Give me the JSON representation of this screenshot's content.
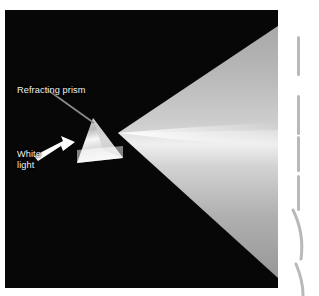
{
  "figure": {
    "kind": "photograph",
    "background_color": "#070707",
    "page_background": "#ffffff"
  },
  "annotations": {
    "prism_label": "Refracting prism",
    "white_light_label_line1": "White",
    "white_light_label_line2": "light",
    "label_color": "#f2f2f2",
    "leader_line_color": "#8c8c8c",
    "arrow_color": "#ffffff"
  },
  "prism": {
    "name": "refracting-prism",
    "fill_color": "#e8e8e8",
    "apex_top": "93,118",
    "base_left": "77,163",
    "base_right": "123,158"
  },
  "spectrum": {
    "name": "dispersed-light-fan",
    "apex": "118,133",
    "colors": [
      "#b2b2b2",
      "#efefef",
      "#c9c9c9",
      "#9a9a9a"
    ],
    "description": "grayscale fan of refracted light spreading right from the prism"
  },
  "margin_marks": {
    "color": "#b9b9b9",
    "dashes": [
      {
        "top": 36,
        "height": 40
      },
      {
        "top": 95,
        "height": 40
      },
      {
        "top": 136,
        "height": 36
      },
      {
        "top": 175,
        "height": 36
      }
    ],
    "arcs": [
      {
        "top": 208,
        "height": 52
      },
      {
        "top": 262,
        "height": 34
      }
    ]
  }
}
